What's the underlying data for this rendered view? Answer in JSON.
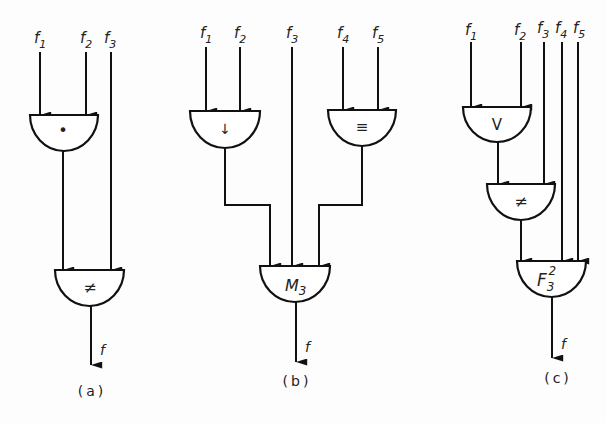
{
  "diagrams": [
    {
      "id": "a",
      "caption": "(a)",
      "inputs": [
        {
          "label": "f",
          "sub": "1"
        },
        {
          "label": "f",
          "sub": "2"
        },
        {
          "label": "f",
          "sub": "3"
        }
      ],
      "gates": [
        {
          "symbol": "•",
          "name": "AND",
          "inputs": [
            "f1",
            "f2"
          ]
        },
        {
          "symbol": "≠",
          "name": "XOR",
          "inputs": [
            "gate1",
            "f3"
          ]
        }
      ],
      "output": "f"
    },
    {
      "id": "b",
      "caption": "(b)",
      "inputs": [
        {
          "label": "f",
          "sub": "1"
        },
        {
          "label": "f",
          "sub": "2"
        },
        {
          "label": "f",
          "sub": "3"
        },
        {
          "label": "f",
          "sub": "4"
        },
        {
          "label": "f",
          "sub": "5"
        }
      ],
      "gates": [
        {
          "symbol": "↓",
          "name": "NOR",
          "inputs": [
            "f1",
            "f2"
          ]
        },
        {
          "symbol": "≡",
          "name": "EQUIV",
          "inputs": [
            "f4",
            "f5"
          ]
        },
        {
          "symbol": "M",
          "sub": "3",
          "name": "MAJORITY",
          "inputs": [
            "gate1",
            "f3",
            "gate2"
          ]
        }
      ],
      "output": "f"
    },
    {
      "id": "c",
      "caption": "(c)",
      "inputs": [
        {
          "label": "f",
          "sub": "1"
        },
        {
          "label": "f",
          "sub": "2"
        },
        {
          "label": "f",
          "sub": "3"
        },
        {
          "label": "f",
          "sub": "4"
        },
        {
          "label": "f",
          "sub": "5"
        }
      ],
      "gates": [
        {
          "symbol": "V",
          "name": "OR",
          "inputs": [
            "f1",
            "f2"
          ]
        },
        {
          "symbol": "≠",
          "name": "XOR",
          "inputs": [
            "gate1",
            "f3"
          ]
        },
        {
          "symbol": "F",
          "sub": "3",
          "sup": "2",
          "name": "THRESHOLD",
          "inputs": [
            "gate2",
            "f4",
            "f5"
          ]
        }
      ],
      "output": "f"
    }
  ]
}
